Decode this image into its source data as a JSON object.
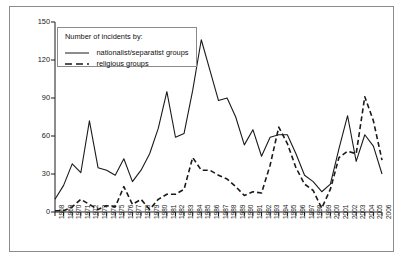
{
  "chart_data": {
    "type": "line",
    "title": "",
    "subtitle": "",
    "xlabel": "",
    "ylabel": "",
    "xlim": [
      1968,
      2006
    ],
    "ylim": [
      0,
      150
    ],
    "yticks": [
      0,
      30,
      60,
      90,
      120,
      150
    ],
    "grid": false,
    "legend_position": "top-left inside plot",
    "legend_title": "Number of incidents by:",
    "x": [
      1968,
      1969,
      1970,
      1971,
      1972,
      1973,
      1974,
      1975,
      1976,
      1977,
      1978,
      1979,
      1980,
      1981,
      1982,
      1983,
      1984,
      1985,
      1986,
      1987,
      1988,
      1989,
      1990,
      1991,
      1992,
      1993,
      1994,
      1995,
      1996,
      1997,
      1998,
      1999,
      2000,
      2001,
      2002,
      2003,
      2004,
      2005,
      2006
    ],
    "xtick_labels": [
      "1968",
      "1969",
      "1970",
      "1971",
      "1972",
      "1973",
      "1974",
      "1975",
      "1976",
      "1977",
      "1978",
      "1979",
      "1980",
      "1981",
      "1982",
      "1983",
      "1984",
      "1985",
      "1986",
      "1987",
      "1988",
      "1989",
      "1990",
      "1991",
      "1992",
      "1993",
      "1994",
      "1995",
      "1996",
      "1997",
      "1998",
      "1999",
      "2000",
      "2001",
      "2002",
      "2003",
      "2004",
      "2005",
      "2006"
    ],
    "series": [
      {
        "name": "nationalist/separatist groups",
        "style": "solid",
        "color": "#1a1a1a",
        "values": [
          10,
          21,
          38,
          31,
          72,
          35,
          33,
          29,
          42,
          24,
          33,
          46,
          66,
          95,
          59,
          62,
          96,
          136,
          112,
          88,
          90,
          75,
          53,
          65,
          44,
          59,
          61,
          61,
          46,
          29,
          24,
          16,
          22,
          50,
          76,
          40,
          61,
          52,
          30
        ]
      },
      {
        "name": "religious groups",
        "style": "dashed",
        "color": "#1a1a1a",
        "values": [
          1,
          1,
          4,
          10,
          6,
          2,
          5,
          4,
          20,
          6,
          10,
          2,
          10,
          14,
          14,
          18,
          43,
          33,
          33,
          29,
          26,
          20,
          13,
          16,
          15,
          37,
          67,
          54,
          35,
          22,
          17,
          3,
          18,
          43,
          48,
          46,
          91,
          72,
          41
        ]
      }
    ]
  },
  "legend": {
    "title": "Number of incidents by:",
    "entries": [
      {
        "label": "nationalist/separatist groups",
        "icon": "solid-line-icon"
      },
      {
        "label": "religious groups",
        "icon": "dashed-line-icon"
      }
    ]
  },
  "axes": {
    "y_tick_0": "0",
    "y_tick_30": "30",
    "y_tick_60": "60",
    "y_tick_90": "90",
    "y_tick_120": "120",
    "y_tick_150": "150"
  }
}
